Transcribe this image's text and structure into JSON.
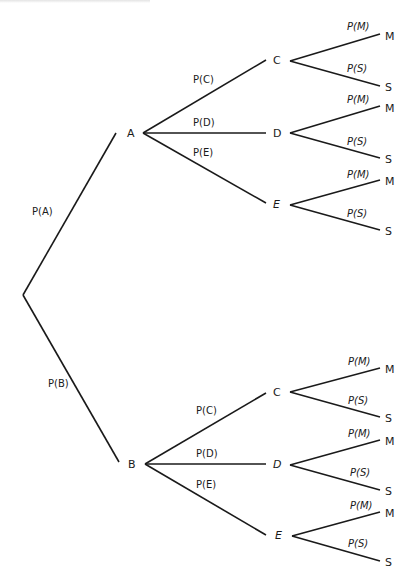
{
  "diagram": {
    "type": "probability-tree",
    "root": {
      "id": "root",
      "x": 23,
      "y": 295,
      "children": [
        {
          "id": "A",
          "label": "A",
          "x": 145,
          "y": 132,
          "edge_label": "P(A)",
          "children": [
            {
              "id": "A-C",
              "label": "C",
              "x": 290,
              "y": 60,
              "edge_label": "P(C)",
              "children": [
                {
                  "label": "M",
                  "x": 385,
                  "y": 34,
                  "edge_label": "P(M)"
                },
                {
                  "label": "S",
                  "x": 385,
                  "y": 86,
                  "edge_label": "P(S)"
                }
              ]
            },
            {
              "id": "A-D",
              "label": "D",
              "x": 290,
              "y": 132,
              "edge_label": "P(D)",
              "children": [
                {
                  "label": "M",
                  "x": 385,
                  "y": 106,
                  "edge_label": "P(M)"
                },
                {
                  "label": "S",
                  "x": 385,
                  "y": 158,
                  "edge_label": "P(S)"
                }
              ]
            },
            {
              "id": "A-E",
              "label": "E",
              "x": 290,
              "y": 204,
              "edge_label": "P(E)",
              "children": [
                {
                  "label": "M",
                  "x": 385,
                  "y": 180,
                  "edge_label": "P(M)"
                },
                {
                  "label": "S",
                  "x": 385,
                  "y": 230,
                  "edge_label": "P(S)"
                }
              ]
            }
          ]
        },
        {
          "id": "B",
          "label": "B",
          "x": 145,
          "y": 463,
          "edge_label": "P(B)",
          "children": [
            {
              "id": "B-C",
              "label": "C",
              "x": 290,
              "y": 392,
              "edge_label": "P(C)",
              "children": [
                {
                  "label": "M",
                  "x": 385,
                  "y": 368,
                  "edge_label": "P(M)"
                },
                {
                  "label": "S",
                  "x": 385,
                  "y": 417,
                  "edge_label": "P(S)"
                }
              ]
            },
            {
              "id": "B-D",
              "label": "D",
              "x": 290,
              "y": 464,
              "edge_label": "P(D)",
              "children": [
                {
                  "label": "M",
                  "x": 385,
                  "y": 440,
                  "edge_label": "P(M)"
                },
                {
                  "label": "S",
                  "x": 385,
                  "y": 490,
                  "edge_label": "P(S)"
                }
              ]
            },
            {
              "id": "B-E",
              "label": "E",
              "x": 290,
              "y": 536,
              "edge_label": "P(E)",
              "children": [
                {
                  "label": "M",
                  "x": 385,
                  "y": 512,
                  "edge_label": "P(M)"
                },
                {
                  "label": "S",
                  "x": 385,
                  "y": 561,
                  "edge_label": "P(S)"
                }
              ]
            }
          ]
        }
      ]
    }
  },
  "labels": {
    "A": "A",
    "B": "B",
    "P_A": "P(A)",
    "P_B": "P(B)",
    "P_C": "P(C)",
    "P_D": "P(D)",
    "P_E": "P(E)",
    "P_M": "P(M)",
    "P_S": "P(S)",
    "C": "C",
    "D": "D",
    "E": "E",
    "M": "M",
    "S": "S"
  }
}
